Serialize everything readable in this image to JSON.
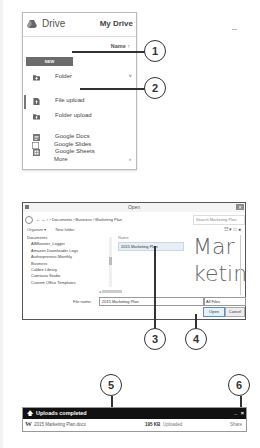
{
  "drive": {
    "title": "Drive",
    "my_drive": "My Drive",
    "sort_label": "Name ↑",
    "new_button": "NEW",
    "menu": [
      {
        "label": "Folder",
        "icon": "folder-plus-icon",
        "caret": "˅"
      },
      {
        "label": "File upload",
        "icon": "file-upload-icon",
        "active": true
      },
      {
        "label": "Folder upload",
        "icon": "folder-upload-icon"
      },
      {
        "label": "Google Docs",
        "icon": "docs-icon"
      },
      {
        "label": "Google Sheets",
        "icon": "sheets-icon"
      },
      {
        "label": "Google Slides",
        "icon": "slides-icon"
      },
      {
        "label": "More",
        "icon": "",
        "caret": "›"
      }
    ]
  },
  "callouts": [
    "1",
    "2",
    "3",
    "4",
    "5",
    "6"
  ],
  "open_dialog": {
    "title": "Open",
    "close": "✕",
    "breadcrumb": "› Documents › Business › Marketing Plan",
    "search_placeholder": "Search Marketing Plan",
    "toolbar": {
      "organize": "Organize ▾",
      "new_folder": "New folder"
    },
    "view_icons": "☷ ▾  □  ●",
    "tree": [
      "Documents",
      "ABBooster_Logger",
      "Amazon Downloader Logs",
      "Authorpreneur-Monthly",
      "Business",
      "Calibre Library",
      "Camtasia Studio",
      "Custom Office Templates",
      "Fax"
    ],
    "column_name": "Name",
    "selected_file": "2015 Marketing Plan",
    "preview_text": [
      "Mar",
      "ketin"
    ],
    "file_name_label": "File name:",
    "file_name_value": "2015 Marketing Plan",
    "file_type": "All Files",
    "open_button": "Open",
    "cancel_button": "Cancel"
  },
  "upload_panel": {
    "title": "Uploads completed",
    "minimize": "_",
    "close": "×",
    "file": {
      "icon": "W",
      "name": "2015 Marketing Plan.docx",
      "size": "195 KB",
      "status": "Uploaded",
      "action": "Share"
    }
  }
}
